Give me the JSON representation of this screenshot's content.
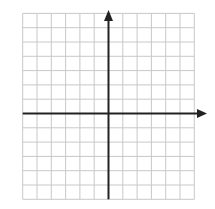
{
  "diagram": {
    "type": "coordinate-grid",
    "grid": {
      "columns_left": 6,
      "columns_right": 6,
      "rows_above": 7,
      "rows_below": 6,
      "spacing_px": 14.3,
      "line_color": "#c8c8c8"
    },
    "axes": {
      "color": "#222222",
      "x_axis": {
        "arrow": "right"
      },
      "y_axis": {
        "arrow": "up"
      }
    }
  }
}
